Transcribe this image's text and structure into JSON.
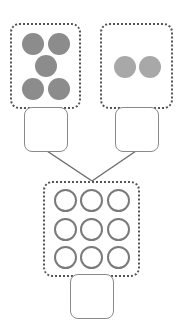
{
  "diagram": {
    "type": "addition-number-bond",
    "groups": [
      {
        "id": "left",
        "dot_count": 5,
        "dot_style": "filled",
        "dot_color": "#8c8c8c",
        "answer": ""
      },
      {
        "id": "right",
        "dot_count": 2,
        "dot_style": "filled",
        "dot_color": "#a8a8a8",
        "answer": ""
      },
      {
        "id": "total",
        "dot_count": 9,
        "dot_style": "hollow",
        "dot_color": "#7a7a7a",
        "answer": ""
      }
    ],
    "colors": {
      "border": "#555555",
      "line": "#6e6e6e",
      "answer_border": "#8a8a8a"
    }
  }
}
